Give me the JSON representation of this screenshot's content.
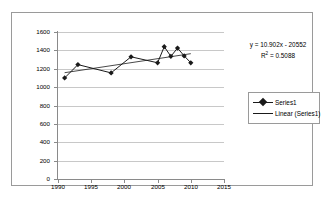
{
  "chart_data": {
    "type": "line",
    "title": "",
    "xlabel": "",
    "ylabel": "",
    "xlim": [
      1990,
      2015
    ],
    "ylim": [
      0,
      1600
    ],
    "grid": true,
    "legend_position": "right",
    "x_ticks": [
      "1990",
      "1995",
      "2000",
      "2005",
      "2010",
      "2015"
    ],
    "x_tick_values": [
      1990,
      1995,
      2000,
      2005,
      2010,
      2015
    ],
    "y_ticks": [
      "0",
      "200",
      "400",
      "600",
      "800",
      "1000",
      "1200",
      "1400",
      "1600"
    ],
    "y_tick_values": [
      0,
      200,
      400,
      600,
      800,
      1000,
      1200,
      1400,
      1600
    ],
    "series": [
      {
        "name": "Series1",
        "marker": "diamond",
        "color": "#1a1a1a",
        "x": [
          1991,
          1993,
          1998,
          2001,
          2005,
          2006,
          2007,
          2008,
          2009,
          2010
        ],
        "values": [
          1100,
          1245,
          1155,
          1330,
          1265,
          1440,
          1335,
          1425,
          1340,
          1265
        ]
      },
      {
        "name": "Linear (Series1)",
        "marker": "none",
        "color": "#1a1a1a",
        "trendline": true,
        "equation": "y = 10.902x - 20552",
        "r_squared": 0.5088,
        "x": [
          1991,
          2010
        ],
        "values": [
          1157,
          1364
        ]
      }
    ],
    "annotations": {
      "equation": "y = 10.902x - 20552",
      "r2_prefix": "R",
      "r2_sup": "2",
      "r2_value": " = 0.5088"
    }
  },
  "legend": {
    "items": [
      {
        "label": "Series1",
        "style": "line-marker"
      },
      {
        "label": "Linear (Series1)",
        "style": "line"
      }
    ]
  }
}
